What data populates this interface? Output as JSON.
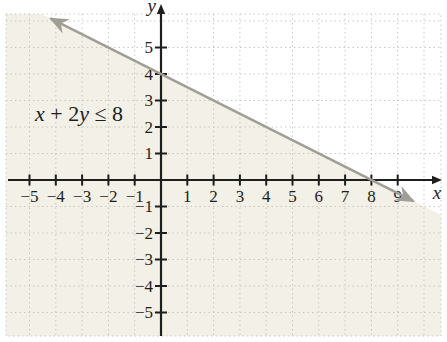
{
  "figure": {
    "inequality_parts": [
      {
        "text": "x",
        "italic": true
      },
      {
        "text": " + 2",
        "italic": false
      },
      {
        "text": "y",
        "italic": true
      },
      {
        "text": " ≤ 8",
        "italic": false
      }
    ]
  },
  "chart_data": {
    "type": "line",
    "title": "",
    "annotation": "x + 2y ≤ 8",
    "boundary_line": {
      "equation": "x + 2y = 8",
      "x_intercept": 8,
      "y_intercept": 4,
      "drawn_from": [
        -4.2,
        6.1
      ],
      "drawn_to": [
        9.6,
        -0.8
      ],
      "arrows_both_ends": true
    },
    "shaded_region": "half-plane on and below the line (solutions of x + 2y ≤ 8)",
    "x_axis": {
      "label": "x",
      "tick_labels": [
        -5,
        -4,
        -3,
        -2,
        -1,
        1,
        2,
        3,
        4,
        5,
        6,
        7,
        8,
        9
      ],
      "range": [
        -5.9,
        10.65
      ]
    },
    "y_axis": {
      "label": "y",
      "tick_labels": [
        5,
        4,
        3,
        2,
        1,
        -1,
        -2,
        -3,
        -4,
        -5
      ],
      "range": [
        -5.9,
        6.3
      ]
    },
    "grid": true,
    "legend": false,
    "colors": {
      "shade": "#f2f0e7",
      "boundary_line": "#a19e97",
      "axis": "#1e1e1c",
      "grid": "#c6c5bb",
      "text": "#1e1e1c"
    }
  }
}
